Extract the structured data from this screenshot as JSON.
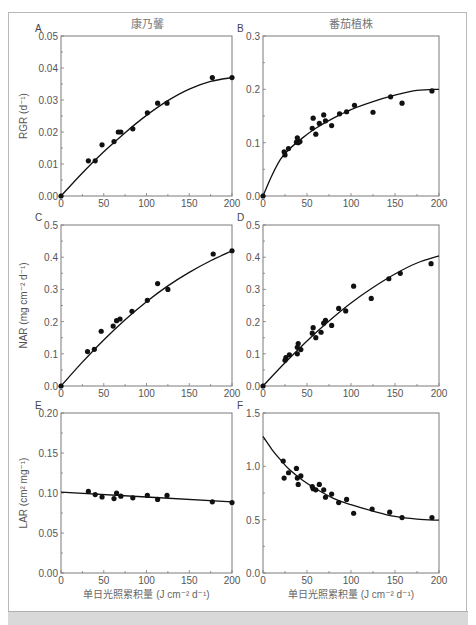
{
  "figure": {
    "column_titles": [
      "康乃馨",
      "番茄植株"
    ],
    "xlabel": "单日光照累积量 (J cm⁻² d⁻¹)"
  },
  "chart_data": [
    {
      "panel": "A",
      "type": "scatter",
      "title": "康乃馨",
      "xlabel": "",
      "ylabel": "RGR (d⁻¹)",
      "xlim": [
        0,
        200
      ],
      "ylim": [
        0,
        0.05
      ],
      "xticks": [
        0,
        50,
        100,
        150,
        200
      ],
      "xtick_labels": [
        "0",
        "50",
        "100",
        "150",
        "200"
      ],
      "yticks": [
        0,
        0.01,
        0.02,
        0.03,
        0.04,
        0.05
      ],
      "ytick_labels": [
        "0.00",
        "0.01",
        "0.02",
        "0.03",
        "0.04",
        "0.05"
      ],
      "points": [
        [
          0,
          0
        ],
        [
          32,
          0.011
        ],
        [
          40,
          0.011
        ],
        [
          48,
          0.016
        ],
        [
          62,
          0.017
        ],
        [
          67,
          0.02
        ],
        [
          70,
          0.02
        ],
        [
          84,
          0.021
        ],
        [
          101,
          0.026
        ],
        [
          113,
          0.029
        ],
        [
          124,
          0.029
        ],
        [
          177,
          0.037
        ],
        [
          200,
          0.037
        ]
      ],
      "fit": [
        [
          0,
          0
        ],
        [
          25,
          0.0072
        ],
        [
          50,
          0.0138
        ],
        [
          75,
          0.0198
        ],
        [
          100,
          0.0252
        ],
        [
          125,
          0.0298
        ],
        [
          150,
          0.0334
        ],
        [
          175,
          0.0358
        ],
        [
          200,
          0.037
        ]
      ]
    },
    {
      "panel": "B",
      "type": "scatter",
      "title": "番茄植株",
      "xlabel": "",
      "ylabel": "",
      "xlim": [
        0,
        200
      ],
      "ylim": [
        0,
        0.3
      ],
      "xticks": [
        0,
        50,
        100,
        150,
        200
      ],
      "xtick_labels": [
        "0",
        "50",
        "100",
        "150",
        "200"
      ],
      "yticks": [
        0,
        0.1,
        0.2,
        0.3
      ],
      "ytick_labels": [
        "0.0",
        "0.1",
        "0.2",
        "0.3"
      ],
      "points": [
        [
          0,
          0
        ],
        [
          24,
          0.083
        ],
        [
          25,
          0.077
        ],
        [
          29,
          0.089
        ],
        [
          38,
          0.101
        ],
        [
          39,
          0.109
        ],
        [
          40,
          0.1
        ],
        [
          42,
          0.102
        ],
        [
          56,
          0.127
        ],
        [
          57,
          0.146
        ],
        [
          60,
          0.116
        ],
        [
          64,
          0.136
        ],
        [
          69,
          0.152
        ],
        [
          71,
          0.141
        ],
        [
          78,
          0.132
        ],
        [
          87,
          0.154
        ],
        [
          95,
          0.158
        ],
        [
          104,
          0.17
        ],
        [
          125,
          0.157
        ],
        [
          145,
          0.186
        ],
        [
          158,
          0.174
        ],
        [
          192,
          0.197
        ]
      ],
      "fit": [
        [
          0,
          0
        ],
        [
          10,
          0.038
        ],
        [
          20,
          0.069
        ],
        [
          30,
          0.088
        ],
        [
          45,
          0.109
        ],
        [
          60,
          0.127
        ],
        [
          80,
          0.146
        ],
        [
          100,
          0.162
        ],
        [
          125,
          0.177
        ],
        [
          150,
          0.189
        ],
        [
          175,
          0.198
        ],
        [
          200,
          0.2
        ]
      ]
    },
    {
      "panel": "C",
      "type": "scatter",
      "title": "",
      "xlabel": "",
      "ylabel": "NAR (mg cm⁻² d⁻¹)",
      "xlim": [
        0,
        200
      ],
      "ylim": [
        0,
        0.5
      ],
      "xticks": [
        0,
        50,
        100,
        150,
        200
      ],
      "xtick_labels": [
        "0",
        "50",
        "100",
        "150",
        "200"
      ],
      "yticks": [
        0,
        0.1,
        0.2,
        0.3,
        0.4,
        0.5
      ],
      "ytick_labels": [
        "0.0",
        "0.1",
        "0.2",
        "0.3",
        "0.4",
        "0.5"
      ],
      "points": [
        [
          0,
          0
        ],
        [
          31,
          0.107
        ],
        [
          39,
          0.114
        ],
        [
          47,
          0.17
        ],
        [
          61,
          0.186
        ],
        [
          65,
          0.203
        ],
        [
          69,
          0.208
        ],
        [
          83,
          0.232
        ],
        [
          101,
          0.266
        ],
        [
          113,
          0.318
        ],
        [
          125,
          0.3
        ],
        [
          178,
          0.41
        ],
        [
          200,
          0.42
        ]
      ],
      "fit": [
        [
          0,
          0
        ],
        [
          25,
          0.074
        ],
        [
          50,
          0.143
        ],
        [
          75,
          0.206
        ],
        [
          100,
          0.262
        ],
        [
          125,
          0.311
        ],
        [
          150,
          0.353
        ],
        [
          175,
          0.389
        ],
        [
          200,
          0.42
        ]
      ]
    },
    {
      "panel": "D",
      "type": "scatter",
      "title": "",
      "xlabel": "",
      "ylabel": "",
      "xlim": [
        0,
        200
      ],
      "ylim": [
        0,
        0.5
      ],
      "xticks": [
        0,
        50,
        100,
        150,
        200
      ],
      "xtick_labels": [
        "0",
        "50",
        "100",
        "150",
        "200"
      ],
      "yticks": [
        0,
        0.1,
        0.2,
        0.3,
        0.4,
        0.5
      ],
      "ytick_labels": [
        "0.0",
        "0.1",
        "0.2",
        "0.3",
        "0.4",
        "0.5"
      ],
      "points": [
        [
          0,
          0
        ],
        [
          25,
          0.08
        ],
        [
          26,
          0.088
        ],
        [
          30,
          0.097
        ],
        [
          39,
          0.1
        ],
        [
          39,
          0.12
        ],
        [
          40,
          0.132
        ],
        [
          43,
          0.113
        ],
        [
          56,
          0.164
        ],
        [
          57,
          0.181
        ],
        [
          60,
          0.15
        ],
        [
          66,
          0.167
        ],
        [
          69,
          0.195
        ],
        [
          71,
          0.204
        ],
        [
          78,
          0.188
        ],
        [
          86,
          0.241
        ],
        [
          94,
          0.233
        ],
        [
          103,
          0.31
        ],
        [
          123,
          0.272
        ],
        [
          143,
          0.333
        ],
        [
          156,
          0.35
        ],
        [
          191,
          0.38
        ]
      ],
      "fit": [
        [
          0,
          0
        ],
        [
          25,
          0.072
        ],
        [
          50,
          0.14
        ],
        [
          75,
          0.202
        ],
        [
          100,
          0.258
        ],
        [
          125,
          0.306
        ],
        [
          150,
          0.348
        ],
        [
          175,
          0.382
        ],
        [
          200,
          0.404
        ]
      ]
    },
    {
      "panel": "E",
      "type": "scatter",
      "title": "",
      "xlabel": "单日光照累积量 (J cm⁻² d⁻¹)",
      "ylabel": "LAR (cm² mg⁻¹)",
      "xlim": [
        0,
        200
      ],
      "ylim": [
        0,
        0.2
      ],
      "xticks": [
        0,
        50,
        100,
        150,
        200
      ],
      "xtick_labels": [
        "0",
        "50",
        "100",
        "150",
        "200"
      ],
      "yticks": [
        0,
        0.05,
        0.1,
        0.15,
        0.2
      ],
      "ytick_labels": [
        "0.00",
        "0.05",
        "0.10",
        "0.15",
        "0.20"
      ],
      "points": [
        [
          32,
          0.102
        ],
        [
          40,
          0.098
        ],
        [
          48,
          0.095
        ],
        [
          62,
          0.093
        ],
        [
          65,
          0.1
        ],
        [
          70,
          0.096
        ],
        [
          84,
          0.094
        ],
        [
          101,
          0.097
        ],
        [
          113,
          0.092
        ],
        [
          124,
          0.097
        ],
        [
          177,
          0.089
        ],
        [
          200,
          0.088
        ]
      ],
      "fit": [
        [
          0,
          0.101
        ],
        [
          200,
          0.089
        ]
      ]
    },
    {
      "panel": "F",
      "type": "scatter",
      "title": "",
      "xlabel": "单日光照累积量 (J cm⁻² d⁻¹)",
      "ylabel": "",
      "xlim": [
        0,
        200
      ],
      "ylim": [
        0,
        1.5
      ],
      "xticks": [
        0,
        50,
        100,
        150,
        200
      ],
      "xtick_labels": [
        "0",
        "50",
        "100",
        "150",
        "200"
      ],
      "yticks": [
        0,
        0.5,
        1.0,
        1.5
      ],
      "ytick_labels": [
        "0.0",
        "0.5",
        "1.0",
        "1.5"
      ],
      "points": [
        [
          23,
          1.05
        ],
        [
          24,
          0.89
        ],
        [
          29,
          0.94
        ],
        [
          38,
          0.98
        ],
        [
          39,
          0.89
        ],
        [
          40,
          0.83
        ],
        [
          43,
          0.91
        ],
        [
          56,
          0.81
        ],
        [
          57,
          0.79
        ],
        [
          60,
          0.78
        ],
        [
          64,
          0.83
        ],
        [
          69,
          0.78
        ],
        [
          71,
          0.71
        ],
        [
          78,
          0.74
        ],
        [
          86,
          0.66
        ],
        [
          95,
          0.69
        ],
        [
          103,
          0.56
        ],
        [
          124,
          0.6
        ],
        [
          144,
          0.57
        ],
        [
          158,
          0.52
        ],
        [
          192,
          0.52
        ]
      ],
      "fit": [
        [
          0,
          1.28
        ],
        [
          10,
          1.16
        ],
        [
          20,
          1.06
        ],
        [
          30,
          0.97
        ],
        [
          45,
          0.87
        ],
        [
          60,
          0.79
        ],
        [
          80,
          0.7
        ],
        [
          100,
          0.64
        ],
        [
          125,
          0.58
        ],
        [
          150,
          0.53
        ],
        [
          175,
          0.505
        ],
        [
          200,
          0.495
        ]
      ]
    }
  ]
}
